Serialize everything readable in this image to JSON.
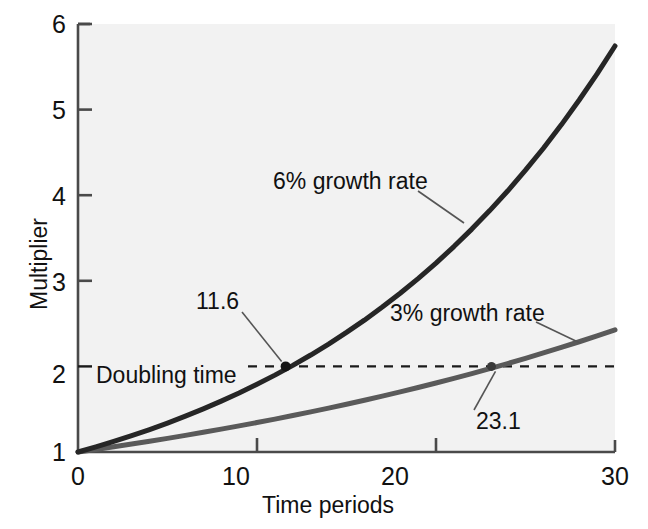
{
  "chart_data": {
    "type": "line",
    "title": "",
    "xlabel": "Time periods",
    "ylabel": "Multiplier",
    "xlim": [
      0,
      30
    ],
    "ylim": [
      1,
      6
    ],
    "xticks": [
      0,
      10,
      20,
      30
    ],
    "yticks": [
      1,
      2,
      3,
      4,
      5,
      6
    ],
    "xtick_labels": [
      "0",
      "10",
      "20",
      "30"
    ],
    "ytick_labels": [
      "1",
      "2",
      "3",
      "4",
      "5",
      "6"
    ],
    "grid": false,
    "legend_position": "inline-annotations",
    "x": [
      0,
      1,
      2,
      3,
      4,
      5,
      6,
      7,
      8,
      9,
      10,
      11,
      12,
      13,
      14,
      15,
      16,
      17,
      18,
      19,
      20,
      21,
      22,
      23,
      24,
      25,
      26,
      27,
      28,
      29,
      30
    ],
    "series": [
      {
        "name": "6% growth rate",
        "color": "#262626",
        "rate": 0.06,
        "values": [
          1.0,
          1.06,
          1.124,
          1.191,
          1.262,
          1.338,
          1.419,
          1.504,
          1.594,
          1.689,
          1.791,
          1.898,
          2.012,
          2.133,
          2.261,
          2.397,
          2.54,
          2.693,
          2.854,
          3.026,
          3.207,
          3.4,
          3.604,
          3.82,
          4.049,
          4.292,
          4.549,
          4.822,
          5.112,
          5.418,
          5.743
        ]
      },
      {
        "name": "3% growth rate",
        "color": "#5a5a5a",
        "rate": 0.03,
        "values": [
          1.0,
          1.03,
          1.061,
          1.093,
          1.126,
          1.159,
          1.194,
          1.23,
          1.267,
          1.305,
          1.344,
          1.384,
          1.426,
          1.469,
          1.513,
          1.558,
          1.605,
          1.653,
          1.702,
          1.754,
          1.806,
          1.86,
          1.916,
          1.974,
          2.033,
          2.094,
          2.157,
          2.221,
          2.288,
          2.357,
          2.427
        ]
      }
    ],
    "reference_lines": [
      {
        "name": "Doubling time",
        "orientation": "horizontal",
        "value": 2,
        "style": "dashed",
        "label": "Doubling time"
      }
    ],
    "annotations": [
      {
        "name": "doubling-point-6pct",
        "label": "11.6",
        "x": 11.6,
        "y": 2,
        "marker": true
      },
      {
        "name": "doubling-point-3pct",
        "label": "23.1",
        "x": 23.1,
        "y": 2,
        "marker": true
      },
      {
        "name": "series-label-6pct",
        "label": "6% growth rate"
      },
      {
        "name": "series-label-3pct",
        "label": "3% growth rate"
      }
    ]
  },
  "labels": {
    "ylabel": "Multiplier",
    "xlabel": "Time periods",
    "doubling_time": "Doubling time",
    "point_6pct": "11.6",
    "point_3pct": "23.1",
    "series_6pct": "6% growth rate",
    "series_3pct": "3% growth rate",
    "y_ticks": [
      "6",
      "5",
      "4",
      "3",
      "2",
      "1"
    ],
    "x_ticks": [
      "0",
      "10",
      "20",
      "30"
    ]
  },
  "colors": {
    "plot_background": "#f2f2f2",
    "page_background": "#ffffff",
    "axis": "#4a4a4a",
    "curve_6pct": "#262626",
    "curve_3pct": "#5a5a5a",
    "text": "#111111"
  }
}
